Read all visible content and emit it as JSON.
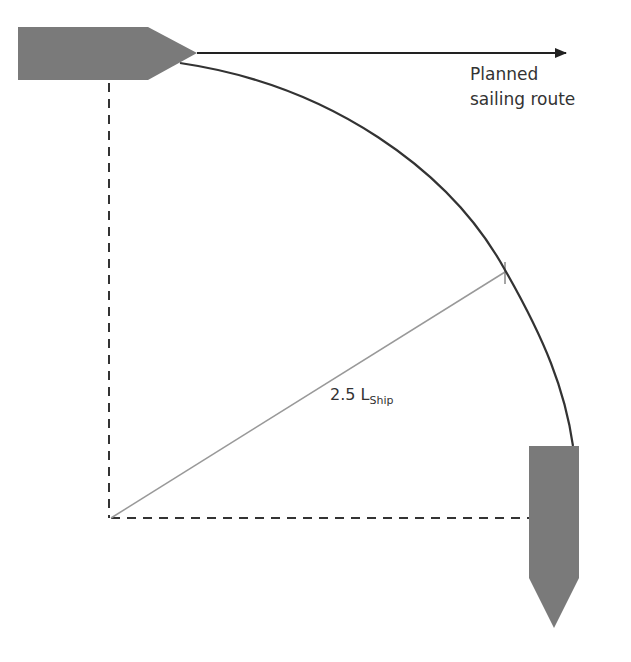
{
  "diagram": {
    "labels": {
      "route_line1": "Planned",
      "route_line2": "sailing route",
      "radius_value": "2.5 L",
      "radius_subscript": "Ship"
    },
    "colors": {
      "ship_fill": "#7a7a7a",
      "arc_stroke": "#333333",
      "radius_stroke": "#999999",
      "dashed_stroke": "#333333",
      "arrow_stroke": "#222222",
      "text": "#333333"
    },
    "elements": [
      "ship-start (pointing right)",
      "ship-end (pointing down)",
      "planned-route-arrow",
      "turning-arc",
      "radius-line",
      "dashed-axes"
    ]
  }
}
